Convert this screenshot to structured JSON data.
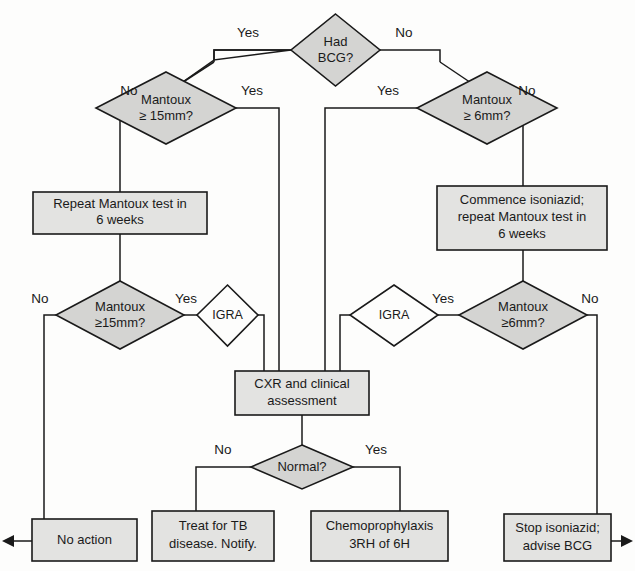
{
  "diagram": {
    "colors": {
      "decision_fill": "#d4d4d2",
      "process_fill": "#e3e3e1",
      "test_fill": "#fdfdfc",
      "stroke": "#1a1a1a",
      "background": "#fdfdfc"
    },
    "nodes": {
      "had_bcg": {
        "label": "Had BCG?",
        "line1": "Had",
        "line2": "BCG?",
        "type": "decision"
      },
      "mantoux15_top": {
        "label": "Mantoux ≥ 15mm?",
        "line1": "Mantoux",
        "line2": "≥ 15mm?",
        "type": "decision"
      },
      "mantoux6_top": {
        "label": "Mantoux ≥ 6mm?",
        "line1": "Mantoux",
        "line2": "≥ 6mm?",
        "type": "decision"
      },
      "repeat_mantoux": {
        "label": "Repeat Mantoux test in 6 weeks",
        "line1": "Repeat Mantoux test in",
        "line2": "6 weeks",
        "type": "process"
      },
      "commence_isoniazid": {
        "label": "Commence isoniazid; repeat Mantoux test in 6 weeks",
        "line1": "Commence isoniazid;",
        "line2": "repeat Mantoux test in",
        "line3": "6 weeks",
        "type": "process"
      },
      "mantoux15_bottom": {
        "label": "Mantoux ≥15mm?",
        "line1": "Mantoux",
        "line2": "≥15mm?",
        "type": "decision"
      },
      "mantoux6_bottom": {
        "label": "Mantoux ≥6mm?",
        "line1": "Mantoux",
        "line2": "≥6mm?",
        "type": "decision"
      },
      "igra_left": {
        "label": "IGRA",
        "line1": "IGRA",
        "type": "test"
      },
      "igra_right": {
        "label": "IGRA",
        "line1": "IGRA",
        "type": "test"
      },
      "cxr": {
        "label": "CXR and clinical assessment",
        "line1": "CXR and clinical",
        "line2": "assessment",
        "type": "process"
      },
      "normal": {
        "label": "Normal?",
        "line1": "Normal?",
        "type": "decision"
      },
      "no_action": {
        "label": "No action",
        "line1": "No action",
        "type": "process"
      },
      "treat_tb": {
        "label": "Treat for TB disease. Notify.",
        "line1": "Treat for TB",
        "line2": "disease. Notify.",
        "type": "process"
      },
      "chemoprophylaxis": {
        "label": "Chemoprophylaxis 3RH of 6H",
        "line1": "Chemoprophylaxis",
        "line2": "3RH of 6H",
        "type": "process"
      },
      "stop_isoniazid": {
        "label": "Stop isoniazid; advise BCG",
        "line1": "Stop isoniazid;",
        "line2": "advise BCG",
        "type": "process"
      }
    },
    "edge_labels": {
      "bcg_yes": "Yes",
      "bcg_no": "No",
      "m15top_no": "No",
      "m15top_yes": "Yes",
      "m6top_yes": "Yes",
      "m6top_no": "No",
      "m15bot_no": "No",
      "m15bot_yes": "Yes",
      "m6bot_yes": "Yes",
      "m6bot_no": "No",
      "normal_no": "No",
      "normal_yes": "Yes"
    }
  }
}
